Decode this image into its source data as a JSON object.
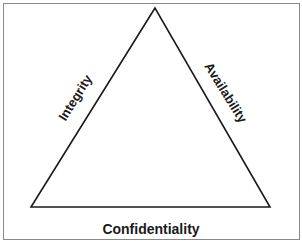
{
  "diagram": {
    "type": "triangle",
    "vertices": {
      "apex": [
        155,
        8
      ],
      "bottom_left": [
        31,
        207
      ],
      "bottom_right": [
        270,
        207
      ]
    },
    "edges": {
      "left": {
        "label": "Integrity"
      },
      "right": {
        "label": "Availability"
      },
      "bottom": {
        "label": "Confidentiality"
      }
    },
    "colors": {
      "line": "#1a1a1a",
      "frame": "#8a8a8a",
      "background": "#ffffff",
      "text": "#1a1a1a"
    }
  }
}
